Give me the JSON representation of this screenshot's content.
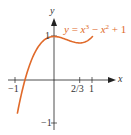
{
  "chart_data": {
    "type": "line",
    "title": "",
    "function": "y = x^3 - x^2 + 1",
    "xlabel": "x",
    "ylabel": "y",
    "xlim": [
      -1,
      1
    ],
    "ylim": [
      -1,
      1
    ],
    "x_ticks": [
      "-1",
      "2/3",
      "1"
    ],
    "y_ticks": [
      "1",
      "-1"
    ],
    "grid": false,
    "series": [
      {
        "name": "y = x^3 - x^2 + 1",
        "color": "#e06a2a",
        "x": [
          -0.95,
          -0.8,
          -0.6,
          -0.4,
          -0.2,
          0,
          0.2,
          0.4,
          0.6667,
          0.8,
          1.0
        ],
        "y": [
          -0.76,
          -0.15,
          0.42,
          0.78,
          0.95,
          1.0,
          0.97,
          0.9,
          0.85,
          0.87,
          1.0
        ]
      }
    ],
    "annotations": [
      {
        "text": "y = x³ − x² + 1",
        "position": "upper-right",
        "color": "#e06a2a"
      }
    ]
  },
  "labels": {
    "x_axis": "x",
    "y_axis": "y",
    "x_neg1": "−1",
    "x_two_thirds": "2/3",
    "x_one": "1",
    "y_one": "1",
    "y_neg1": "−1",
    "eq_y": "y",
    "eq_eq": " = ",
    "eq_x1": "x",
    "eq_p1": "3",
    "eq_minus": " − ",
    "eq_x2": "x",
    "eq_p2": "2",
    "eq_tail": " + 1"
  },
  "colors": {
    "curve": "#e06a2a",
    "axis": "#222222"
  }
}
